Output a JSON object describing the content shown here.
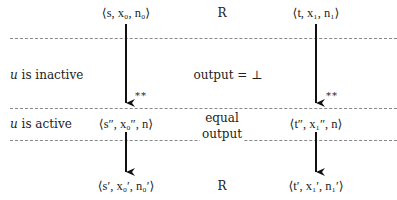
{
  "diagram": {
    "left_column": {
      "top": "⟨s, x₀, n₀⟩",
      "middle": "⟨s″, x₀″, n⟩",
      "bottom": "⟨s′, x₀′, n₀′⟩",
      "arrow_annotation": "**"
    },
    "right_column": {
      "top": "⟨t, x₁, n₁⟩",
      "middle": "⟨t″, x₁″, n⟩",
      "bottom": "⟨t′, x₁′, n₁′⟩",
      "arrow_annotation": "**"
    },
    "relation_top": "R",
    "relation_bottom": "R",
    "row_labels": {
      "inactive_var": "u",
      "inactive_text": " is inactive",
      "active_var": "u",
      "active_text": " is active"
    },
    "center_notes": {
      "inactive_output": "output = ⊥",
      "active_line1": "equal",
      "active_line2": "output"
    }
  }
}
